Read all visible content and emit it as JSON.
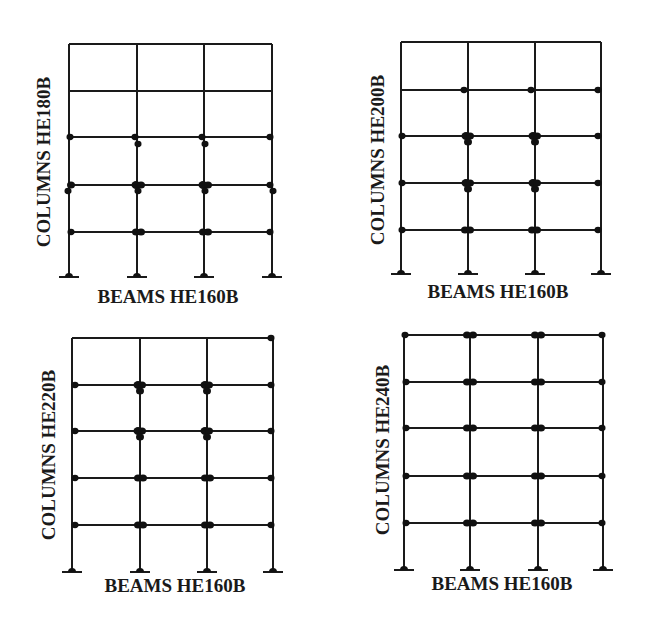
{
  "figure": {
    "colors": {
      "line": "#1a1a1a",
      "hinge": "#111111",
      "background": "#ffffff"
    },
    "panels": [
      {
        "id": "panel-he180b",
        "column_label": "COLUMNS HE180B",
        "beam_label": "BEAMS HE160B",
        "columns_x": [
          69,
          137,
          204,
          272
        ],
        "floors_y": [
          44,
          91,
          137,
          185,
          232
        ],
        "base_y": 277,
        "column_label_pos": {
          "x": 50,
          "y": 162
        },
        "beam_label_pos": {
          "x": 168,
          "y": 303
        },
        "hinges": [
          [
            70,
            137,
            3.5
          ],
          [
            135,
            137,
            3.5
          ],
          [
            138,
            144,
            3.5
          ],
          [
            202,
            137,
            3.5
          ],
          [
            205,
            144,
            3.5
          ],
          [
            270,
            137,
            3.5
          ],
          [
            71,
            185,
            4
          ],
          [
            68,
            191,
            3.5
          ],
          [
            136,
            185,
            4.5
          ],
          [
            141,
            185,
            4
          ],
          [
            138,
            191,
            3.5
          ],
          [
            203,
            185,
            4.5
          ],
          [
            208,
            185,
            4
          ],
          [
            205,
            191,
            3.5
          ],
          [
            270,
            185,
            3.5
          ],
          [
            273,
            191,
            3.5
          ],
          [
            71,
            232,
            3.5
          ],
          [
            136,
            232,
            4
          ],
          [
            141,
            232,
            4
          ],
          [
            203,
            232,
            4
          ],
          [
            208,
            232,
            4
          ],
          [
            270,
            232,
            3.5
          ]
        ]
      },
      {
        "id": "panel-he200b",
        "column_label": "COLUMNS HE200B",
        "beam_label": "BEAMS HE160B",
        "columns_x": [
          401,
          468,
          535,
          601
        ],
        "floors_y": [
          42,
          90,
          136,
          183,
          230
        ],
        "base_y": 274,
        "column_label_pos": {
          "x": 384,
          "y": 160
        },
        "beam_label_pos": {
          "x": 498,
          "y": 298
        },
        "hinges": [
          [
            464,
            90,
            3.5
          ],
          [
            531,
            90,
            3.5
          ],
          [
            598,
            90,
            3.5
          ],
          [
            402,
            136,
            3.5
          ],
          [
            466,
            136,
            4.5
          ],
          [
            470,
            136,
            4
          ],
          [
            468,
            142,
            4
          ],
          [
            533,
            136,
            4.5
          ],
          [
            537,
            136,
            4
          ],
          [
            535,
            142,
            4
          ],
          [
            598,
            136,
            3.5
          ],
          [
            402,
            183,
            3.5
          ],
          [
            466,
            183,
            4.5
          ],
          [
            470,
            183,
            4
          ],
          [
            468,
            189,
            4
          ],
          [
            533,
            183,
            4.5
          ],
          [
            537,
            183,
            4
          ],
          [
            535,
            189,
            4
          ],
          [
            598,
            183,
            3.5
          ],
          [
            402,
            230,
            3.5
          ],
          [
            465,
            230,
            4
          ],
          [
            470,
            230,
            4
          ],
          [
            532,
            230,
            4
          ],
          [
            537,
            230,
            4
          ],
          [
            598,
            230,
            3.5
          ]
        ]
      },
      {
        "id": "panel-he220b",
        "column_label": "COLUMNS HE220B",
        "beam_label": "BEAMS HE160B",
        "columns_x": [
          72,
          140,
          207,
          273
        ],
        "floors_y": [
          338,
          385,
          431,
          478,
          525
        ],
        "base_y": 572,
        "column_label_pos": {
          "x": 55,
          "y": 455
        },
        "beam_label_pos": {
          "x": 175,
          "y": 592
        },
        "hinges": [
          [
            271,
            338,
            3.5
          ],
          [
            75,
            385,
            3.5
          ],
          [
            138,
            385,
            4.5
          ],
          [
            142,
            385,
            4
          ],
          [
            140,
            391,
            4
          ],
          [
            205,
            385,
            4.5
          ],
          [
            209,
            385,
            4
          ],
          [
            207,
            391,
            4
          ],
          [
            271,
            385,
            3.5
          ],
          [
            75,
            431,
            3.5
          ],
          [
            138,
            431,
            4.5
          ],
          [
            142,
            431,
            4
          ],
          [
            140,
            437,
            4
          ],
          [
            205,
            431,
            4.5
          ],
          [
            209,
            431,
            4
          ],
          [
            207,
            437,
            4
          ],
          [
            271,
            431,
            3.5
          ],
          [
            75,
            478,
            3.5
          ],
          [
            138,
            478,
            4
          ],
          [
            143,
            478,
            4
          ],
          [
            205,
            478,
            4
          ],
          [
            210,
            478,
            4
          ],
          [
            271,
            478,
            3.5
          ],
          [
            75,
            525,
            3.5
          ],
          [
            138,
            525,
            4
          ],
          [
            143,
            525,
            4
          ],
          [
            205,
            525,
            4
          ],
          [
            210,
            525,
            4
          ],
          [
            271,
            525,
            3.5
          ]
        ]
      },
      {
        "id": "panel-he240b",
        "column_label": "COLUMNS HE240B",
        "beam_label": "BEAMS HE160B",
        "columns_x": [
          404,
          470,
          538,
          603
        ],
        "floors_y": [
          335,
          382,
          428,
          476,
          523
        ],
        "base_y": 570,
        "column_label_pos": {
          "x": 389,
          "y": 450
        },
        "beam_label_pos": {
          "x": 502,
          "y": 590
        },
        "hinges": [
          [
            405,
            335,
            3.5
          ],
          [
            467,
            335,
            4
          ],
          [
            473,
            335,
            4
          ],
          [
            535,
            335,
            4
          ],
          [
            541,
            335,
            4
          ],
          [
            602,
            335,
            3.5
          ],
          [
            406,
            382,
            3.5
          ],
          [
            467,
            382,
            4
          ],
          [
            473,
            382,
            4
          ],
          [
            535,
            382,
            4
          ],
          [
            541,
            382,
            4
          ],
          [
            602,
            382,
            3.5
          ],
          [
            406,
            428,
            3.5
          ],
          [
            467,
            428,
            4
          ],
          [
            473,
            428,
            4
          ],
          [
            535,
            428,
            4
          ],
          [
            541,
            428,
            4
          ],
          [
            602,
            428,
            3.5
          ],
          [
            406,
            476,
            3.5
          ],
          [
            467,
            476,
            4
          ],
          [
            473,
            476,
            4
          ],
          [
            535,
            476,
            4
          ],
          [
            541,
            476,
            4
          ],
          [
            602,
            476,
            3.5
          ],
          [
            406,
            523,
            3.5
          ],
          [
            467,
            523,
            4
          ],
          [
            473,
            523,
            4
          ],
          [
            535,
            523,
            4
          ],
          [
            541,
            523,
            4
          ],
          [
            602,
            523,
            3.5
          ]
        ]
      }
    ]
  }
}
